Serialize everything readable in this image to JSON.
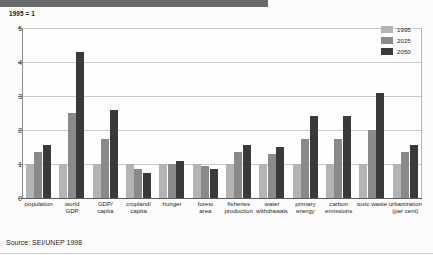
{
  "header": {
    "unit_note": "1995 = 1"
  },
  "source": {
    "text": "Source: SEI/UNEP 1998"
  },
  "legend": {
    "position": "top-right",
    "entries": [
      {
        "label": "1995",
        "color": "#b4b4b4"
      },
      {
        "label": "2025",
        "color": "#8a8a8a"
      },
      {
        "label": "2050",
        "color": "#3a3a3a"
      }
    ]
  },
  "chart_data": {
    "type": "bar",
    "title": "",
    "subtitle": "1995 = 1",
    "xlabel": "",
    "ylabel": "",
    "ylim": [
      0,
      5
    ],
    "yticks": [
      0,
      1,
      2,
      3,
      4,
      5
    ],
    "ytick_labels": [
      "0",
      "1",
      "2",
      "3",
      "4",
      "5"
    ],
    "grid": true,
    "legend_position": "top-right",
    "categories": [
      "population",
      "world GDP",
      "GDP/ capita",
      "cropland/ capita",
      "hunger",
      "forest area",
      "fisheries production",
      "water withdrawals",
      "primary energy",
      "carbon emissions",
      "toxic waste",
      "urbanization (per cent)"
    ],
    "category_lines": [
      [
        "population"
      ],
      [
        "world",
        "GDP"
      ],
      [
        "GDP/",
        "capita"
      ],
      [
        "cropland/",
        "capita"
      ],
      [
        "hunger"
      ],
      [
        "forest",
        "area"
      ],
      [
        "fisheries",
        "production"
      ],
      [
        "water",
        "withdrawals"
      ],
      [
        "primary",
        "energy"
      ],
      [
        "carbon",
        "emissions"
      ],
      [
        "toxic waste"
      ],
      [
        "urbanization",
        "(per cent)"
      ]
    ],
    "series": [
      {
        "name": "1995",
        "color": "#b4b4b4",
        "values": [
          1,
          1,
          1,
          1,
          1,
          1,
          1,
          1,
          1,
          1,
          1,
          1
        ]
      },
      {
        "name": "2025",
        "color": "#8a8a8a",
        "values": [
          1.35,
          2.5,
          1.75,
          0.85,
          1.0,
          0.95,
          1.35,
          1.3,
          1.75,
          1.75,
          2.0,
          1.35
        ]
      },
      {
        "name": "2050",
        "color": "#3a3a3a",
        "values": [
          1.55,
          4.3,
          2.6,
          0.75,
          1.1,
          0.85,
          1.55,
          1.5,
          2.4,
          2.4,
          3.1,
          1.55
        ]
      }
    ]
  }
}
